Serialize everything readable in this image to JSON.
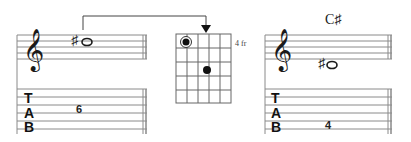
{
  "left_example": {
    "clef": "treble-clef",
    "note": {
      "accidental": "♯",
      "glyph": "o",
      "name": "C#"
    },
    "tab_label": [
      "T",
      "A",
      "B"
    ],
    "tab_fret": "6",
    "tab_string": 3
  },
  "chord_diagram": {
    "fret_label": "4 fr",
    "strings": 6,
    "frets": 5,
    "dots": [
      {
        "string": 1,
        "fret": 1,
        "type": "root"
      },
      {
        "string": 4,
        "fret": 3,
        "type": "normal"
      }
    ]
  },
  "right_example": {
    "chord_name": "C♯",
    "clef": "treble-clef",
    "note": {
      "accidental": "♯",
      "glyph": "o",
      "name": "C#"
    },
    "tab_label": [
      "T",
      "A",
      "B"
    ],
    "tab_fret": "4",
    "tab_string": 5
  },
  "colors": {
    "ink": "#1a1a1a",
    "line": "#777777"
  }
}
